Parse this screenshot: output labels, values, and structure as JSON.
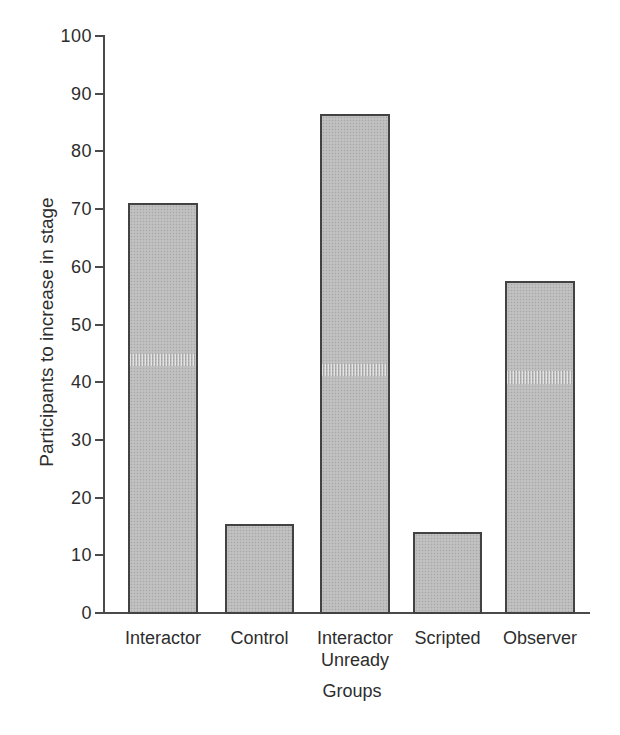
{
  "chart_data": {
    "type": "bar",
    "title": "",
    "categories": [
      "Interactor",
      "Control",
      "Interactor Unready",
      "Scripted",
      "Observer"
    ],
    "category_label_lines": [
      [
        "Interactor"
      ],
      [
        "Control"
      ],
      [
        "Interactor",
        "Unready"
      ],
      [
        "Scripted"
      ],
      [
        "Observer"
      ]
    ],
    "values": [
      71,
      15.5,
      86.5,
      14,
      57.5
    ],
    "xlabel": "Groups",
    "ylabel": "Participants to increase in stage",
    "ylim": [
      0,
      100
    ],
    "ytick_interval": 10,
    "ytick_labels": [
      "0",
      "10",
      "20",
      "30",
      "40",
      "50",
      "60",
      "70",
      "80",
      "90",
      "100"
    ],
    "grid": false,
    "legend": "none",
    "colors": {
      "bar_fill": "#c9c9c9",
      "bar_dot": "#a7a7a7",
      "bar_border": "#424242",
      "axis": "#4a4a4a",
      "text": "#2d2d2d",
      "background": "#ffffff"
    }
  }
}
